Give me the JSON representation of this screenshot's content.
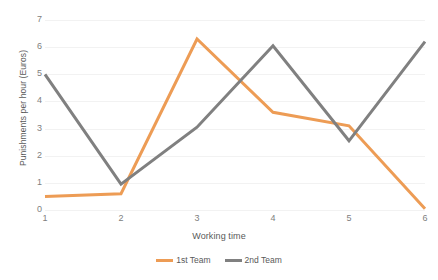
{
  "chart_data": {
    "type": "line",
    "title": "",
    "xlabel": "Working time",
    "ylabel": "Punishments per hour (Euros)",
    "x": [
      1,
      2,
      3,
      4,
      5,
      6
    ],
    "xticklabels": [
      "1",
      "2",
      "3",
      "4",
      "5",
      "6"
    ],
    "yticklabels": [
      "0",
      "1",
      "2",
      "3",
      "4",
      "5",
      "6",
      "7"
    ],
    "yticks": [
      0,
      1,
      2,
      3,
      4,
      5,
      6,
      7
    ],
    "ylim": [
      0,
      7
    ],
    "xlim": [
      1,
      6
    ],
    "grid": "horizontal",
    "legend_position": "bottom",
    "series": [
      {
        "name": "1st Team",
        "color": "#ED9C55",
        "values": [
          0.5,
          0.6,
          6.3,
          3.6,
          3.1,
          0.05
        ]
      },
      {
        "name": "2nd Team",
        "color": "#808080",
        "values": [
          5.0,
          0.95,
          3.05,
          6.05,
          2.55,
          6.2
        ]
      }
    ]
  },
  "colors": {
    "series_1st_team": "#ED9C55",
    "series_2nd_team": "#808080",
    "gridline": "#F2F2F2",
    "tick_text": "#808080",
    "axis_title_text": "#595959",
    "background": "#FFFFFF"
  }
}
